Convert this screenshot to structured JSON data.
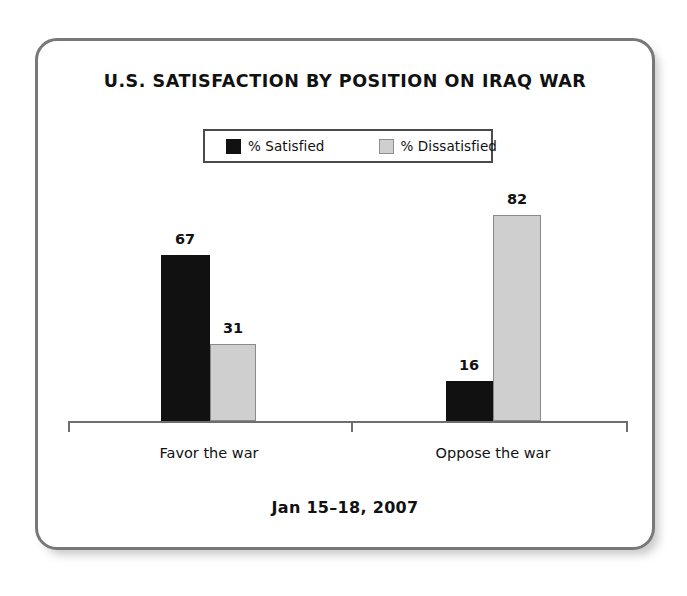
{
  "card": {
    "border_color": "#77787a",
    "background": "#ffffff"
  },
  "chart_data": {
    "type": "bar",
    "title": "U.S. SATISFACTION BY POSITION ON IRAQ WAR",
    "subtitle": "",
    "footer": "Jan 15–18, 2007",
    "xlabel": "",
    "ylabel": "",
    "ylim": [
      0,
      100
    ],
    "grid": false,
    "legend_position": "top-center",
    "categories": [
      "Favor the war",
      "Oppose the war"
    ],
    "series": [
      {
        "name": "% Satisfied",
        "color": "#111111",
        "values": [
          67,
          16
        ]
      },
      {
        "name": "% Dissatisfied",
        "color": "#cfcfcf",
        "values": [
          31,
          82
        ]
      }
    ],
    "value_labels": {
      "favor_satisfied": "67",
      "favor_dissatisfied": "31",
      "oppose_satisfied": "16",
      "oppose_dissatisfied": "82"
    },
    "axis": {
      "baseline_visible": true,
      "tick_marks": [
        "left-end",
        "group-separator",
        "right-end"
      ],
      "axis_color": "#6d6e70"
    }
  },
  "legend": {
    "entries": [
      {
        "label": "% Satisfied",
        "swatch": "black-square-swatch"
      },
      {
        "label": "% Dissatisfied",
        "swatch": "gray-square-swatch"
      }
    ],
    "border_color": "#4a4a4c"
  }
}
